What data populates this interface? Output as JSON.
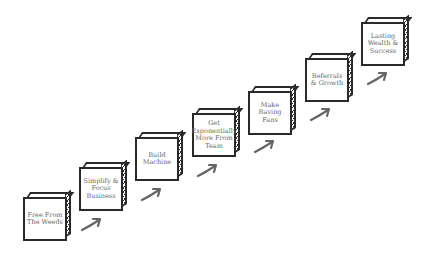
{
  "diagram": {
    "type": "staircase-process",
    "colors": {
      "stroke": "#2a2a2a",
      "text": "#666666",
      "arrow": "#666666",
      "background": "#ffffff"
    },
    "steps": [
      {
        "label": "Free From\nThe Weeds"
      },
      {
        "label": "Simplify &\nFocus\nBusiness"
      },
      {
        "label": "Build\nMachine"
      },
      {
        "label": "Get\nExponentially\nMore From\nTeam"
      },
      {
        "label": "Make\nRaving\nFans"
      },
      {
        "label": "Referrals\n& Growth"
      },
      {
        "label": "Lasting\nWealth &\nSuccess"
      }
    ],
    "arrows": [
      {
        "icon": "curved-arrow-up-right"
      },
      {
        "icon": "curved-arrow-up-right"
      },
      {
        "icon": "curved-arrow-up-right"
      },
      {
        "icon": "curved-arrow-up-right"
      },
      {
        "icon": "curved-arrow-up-right"
      },
      {
        "icon": "curved-arrow-up-right"
      }
    ]
  }
}
